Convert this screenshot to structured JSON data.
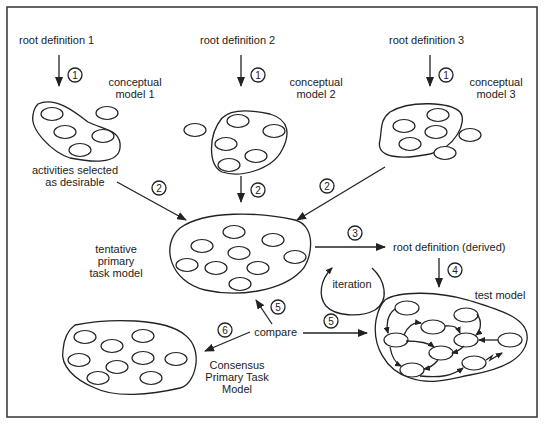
{
  "root_definitions": [
    {
      "label": "root definition 1"
    },
    {
      "label": "root definition 2"
    },
    {
      "label": "root definition 3"
    }
  ],
  "conceptual_models": [
    {
      "line1": "conceptual",
      "line2": "model 1"
    },
    {
      "line1": "conceptual",
      "line2": "model 2"
    },
    {
      "line1": "conceptual",
      "line2": "model 3"
    }
  ],
  "activities_label": {
    "line1": "activities selected",
    "line2": "as desirable"
  },
  "tentative_model": {
    "line1": "tentative",
    "line2": "primary",
    "line3": "task model"
  },
  "root_derived": "root definition (derived)",
  "iteration": "iteration",
  "test_model": "test model",
  "compare": "compare",
  "consensus_model": {
    "line1": "Consensus",
    "line2": "Primary Task",
    "line3": "Model"
  },
  "steps": {
    "s1": "1",
    "s2": "2",
    "s3": "3",
    "s4": "4",
    "s5": "5",
    "s6": "6"
  }
}
